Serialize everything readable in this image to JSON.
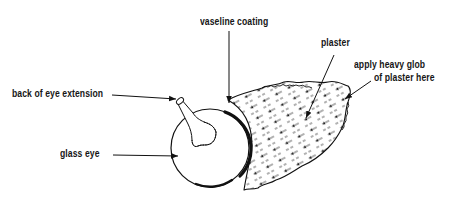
{
  "diagram": {
    "labels": {
      "vaseline": "vaseline coating",
      "plaster": "plaster",
      "apply_line1": "apply heavy glob",
      "apply_line2": "of plaster here",
      "back_of_eye": "back of eye extension",
      "glass_eye": "glass eye"
    },
    "parts": [
      {
        "id": "glass-eye",
        "shape": "sphere"
      },
      {
        "id": "back-of-eye-extension",
        "shape": "stem"
      },
      {
        "id": "vaseline-coating",
        "shape": "thick-arc"
      },
      {
        "id": "plaster-mass",
        "shape": "hatched-blob"
      }
    ],
    "colors": {
      "ink": "#111111",
      "background": "#ffffff"
    }
  }
}
